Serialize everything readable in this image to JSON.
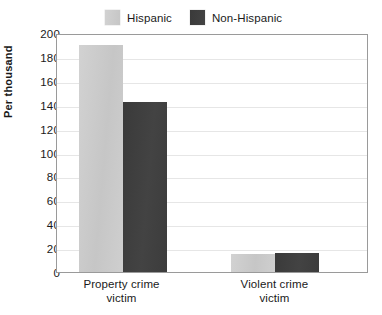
{
  "chart_data": {
    "type": "bar",
    "title": "",
    "xlabel": "",
    "ylabel": "Per thousand",
    "ylim": [
      0,
      200
    ],
    "ytick_step": 20,
    "yticks": [
      200,
      180,
      160,
      140,
      120,
      100,
      80,
      60,
      40,
      20,
      0
    ],
    "grid": true,
    "legend_position": "top",
    "categories": [
      "Property crime victim",
      "Violent crime victim"
    ],
    "category_lines": [
      [
        "Property crime",
        "victim"
      ],
      [
        "Violent crime",
        "victim"
      ]
    ],
    "series": [
      {
        "name": "Hispanic",
        "color": "#c8c8c8",
        "values": [
          190,
          15
        ]
      },
      {
        "name": "Non-Hispanic",
        "color": "#3d3d3d",
        "values": [
          142,
          16
        ]
      }
    ]
  },
  "legend": {
    "entries": [
      {
        "label": "Hispanic",
        "swatch": "light-gray-swatch"
      },
      {
        "label": "Non-Hispanic",
        "swatch": "dark-gray-swatch"
      }
    ]
  },
  "axes": {
    "y_title": "Per thousand",
    "y_labels": [
      "200",
      "180",
      "160",
      "140",
      "120",
      "100",
      "80",
      "60",
      "40",
      "20",
      "0"
    ],
    "x_labels": [
      {
        "line1": "Property crime",
        "line2": "victim"
      },
      {
        "line1": "Violent crime",
        "line2": "victim"
      }
    ]
  },
  "colors": {
    "series_light": "#c8c8c8",
    "series_dark": "#3d3d3d",
    "grid": "#e6e6e6",
    "frame": "#9a9a9a",
    "text": "#1a1a1a",
    "background": "#ffffff"
  }
}
